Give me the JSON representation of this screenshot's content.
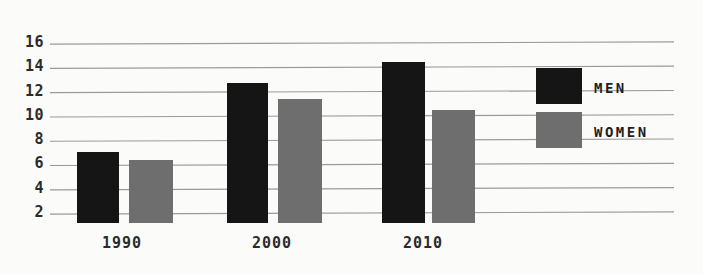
{
  "chart_data": {
    "type": "bar",
    "title": "",
    "subtitle": "",
    "xlabel": "",
    "ylabel": "",
    "categories": [
      "1990",
      "2000",
      "2010"
    ],
    "series": [
      {
        "name": "MEN",
        "color": "#151515",
        "values": [
          7.0,
          12.7,
          14.4
        ]
      },
      {
        "name": "WOMEN",
        "color": "#6e6e6e",
        "values": [
          6.4,
          11.4,
          10.5
        ]
      }
    ],
    "ylim": [
      2,
      16
    ],
    "yticks": [
      16,
      14,
      12,
      10,
      8,
      6,
      4,
      2
    ],
    "ytick_labels": [
      "16",
      "14",
      "12",
      "10",
      "8",
      "6",
      "4",
      "2"
    ],
    "grid": true,
    "grid_axis": "y",
    "grid_color": "#9a9a9a",
    "legend_position": "right",
    "legend": [
      {
        "label": "MEN",
        "color": "#151515"
      },
      {
        "label": "WOMEN",
        "color": "#6e6e6e"
      }
    ],
    "background": "#fbfbfa",
    "note": "bars are drawn from the value down past the 2-gridline and clipped at the plot bottom"
  },
  "layout": {
    "plot_left": 50,
    "plot_right": 674,
    "y_top_px": 43,
    "y_bottom_px": 213,
    "bar_bottom_px": 223,
    "groups": [
      {
        "category": "1990",
        "label_x": 122,
        "bars": [
          {
            "x": 77,
            "w": 42
          },
          {
            "x": 129,
            "w": 44
          }
        ]
      },
      {
        "category": "2000",
        "label_x": 272,
        "bars": [
          {
            "x": 227,
            "w": 41
          },
          {
            "x": 278,
            "w": 44
          }
        ]
      },
      {
        "category": "2010",
        "label_x": 423,
        "bars": [
          {
            "x": 382,
            "w": 43
          },
          {
            "x": 432,
            "w": 43
          }
        ]
      }
    ],
    "xtick_y": 236,
    "legend_items": [
      {
        "swatch_x": 536,
        "swatch_y": 68,
        "swatch_w": 46,
        "swatch_h": 36,
        "label_x": 594,
        "label_y": 81
      },
      {
        "swatch_x": 536,
        "swatch_y": 112,
        "swatch_w": 46,
        "swatch_h": 36,
        "label_x": 594,
        "label_y": 125
      }
    ]
  }
}
